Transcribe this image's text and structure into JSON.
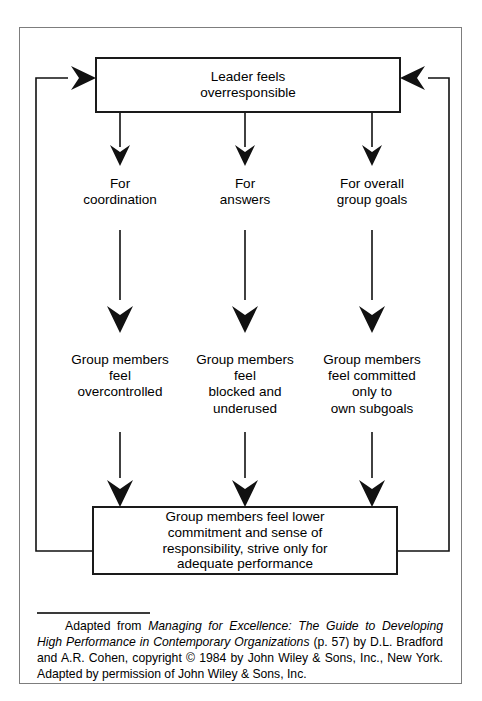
{
  "figure": {
    "type": "flow-diagram",
    "title_box": "Leader feels overresponsible",
    "colors": {
      "ink": "#000000",
      "frame": "#7d7d7d",
      "box_border": "#1a1a1a",
      "background": "#ffffff"
    }
  },
  "nodes": {
    "leader": {
      "line1": "Leader feels",
      "line2": "overresponsible"
    },
    "reasons": [
      {
        "id": "coordination",
        "line1": "For",
        "line2": "coordination"
      },
      {
        "id": "answers",
        "line1": "For",
        "line2": "answers"
      },
      {
        "id": "group-goals",
        "line1": "For overall",
        "line2": "group goals"
      }
    ],
    "effects": [
      {
        "id": "overcontrolled",
        "line1": "Group members",
        "line2": "feel",
        "line3": "overcontrolled",
        "line4": ""
      },
      {
        "id": "blocked",
        "line1": "Group members",
        "line2": "feel",
        "line3": "blocked and",
        "line4": "underused"
      },
      {
        "id": "subgoals",
        "line1": "Group members",
        "line2": "feel committed",
        "line3": "only to",
        "line4": "own subgoals"
      }
    ],
    "outcome": {
      "line1": "Group members feel lower",
      "line2": "commitment and sense of",
      "line3": "responsibility, strive only for",
      "line4": "adequate performance"
    }
  },
  "connectors": {
    "down_arrow_count": 9,
    "feedback_left": "outcome-to-leader",
    "feedback_right": "outcome-to-leader"
  },
  "caption": {
    "part1": "Adapted from ",
    "italic1": "Managing for Excellence: The Guide to Developing High Performance in Contemporary Organizations",
    "part2": " (p. 57) by D.L. Bradford and A.R. Cohen, copyright ",
    "copyright_symbol": "©",
    "part3": " 1984 by John Wiley & Sons, Inc., New York. Adapted by permission of John Wiley & Sons, Inc."
  }
}
